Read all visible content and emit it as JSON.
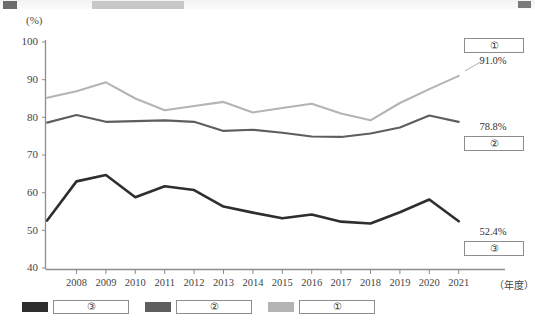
{
  "axis": {
    "unit_label": "(%)",
    "x_unit_label": "（年度）",
    "y_ticks": [
      "100",
      "90",
      "80",
      "70",
      "60",
      "50",
      "40"
    ],
    "x_ticks": [
      "2008",
      "2009",
      "2010",
      "2011",
      "2012",
      "2013",
      "2014",
      "2015",
      "2016",
      "2017",
      "2018",
      "2019",
      "2020",
      "2021"
    ]
  },
  "callouts": [
    {
      "name": "series-1-callout",
      "label": "①",
      "value": "91.0%"
    },
    {
      "name": "series-2-callout",
      "label": "②",
      "value": "78.8%"
    },
    {
      "name": "series-3-callout",
      "label": "③",
      "value": "52.4%"
    }
  ],
  "legend": {
    "position": "bottom-left",
    "items": [
      {
        "label": "③",
        "color": "#2e2e2e"
      },
      {
        "label": "②",
        "color": "#5e5e5e"
      },
      {
        "label": "①",
        "color": "#b4b4b4"
      }
    ]
  },
  "colors": {
    "series_1": "#b4b4b4",
    "series_2": "#5e5e5e",
    "series_3": "#2e2e2e",
    "axis": "#8d8d8d",
    "text": "#3a3a3a"
  },
  "chart_data": {
    "type": "line",
    "title": "",
    "xlabel": "（年度）",
    "ylabel": "(%)",
    "ylim": [
      40,
      100
    ],
    "grid": false,
    "legend_position": "bottom-left",
    "categories": [
      "2007",
      "2008",
      "2009",
      "2010",
      "2011",
      "2012",
      "2013",
      "2014",
      "2015",
      "2016",
      "2017",
      "2018",
      "2019",
      "2020",
      "2021"
    ],
    "series": [
      {
        "name": "①",
        "color": "#b4b4b4",
        "end_value_label": "91.0%",
        "values": [
          85.2,
          86.9,
          89.3,
          85.0,
          81.9,
          83.0,
          84.1,
          81.3,
          82.5,
          83.6,
          81.0,
          79.2,
          83.8,
          87.5,
          91.0
        ]
      },
      {
        "name": "②",
        "color": "#5e5e5e",
        "end_value_label": "78.8%",
        "values": [
          78.6,
          80.6,
          78.8,
          79.0,
          79.2,
          78.8,
          76.4,
          76.7,
          75.9,
          74.9,
          74.8,
          75.7,
          77.3,
          80.5,
          78.8
        ]
      },
      {
        "name": "③",
        "color": "#2e2e2e",
        "end_value_label": "52.4%",
        "values": [
          52.6,
          63.0,
          64.7,
          58.8,
          61.7,
          60.7,
          56.3,
          54.7,
          53.2,
          54.2,
          52.3,
          51.8,
          54.8,
          58.2,
          52.4
        ]
      }
    ]
  }
}
